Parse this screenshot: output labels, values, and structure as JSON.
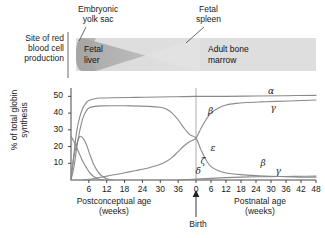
{
  "figure": {
    "callouts": {
      "yolk_sac": "Embryonic\nyolk sac",
      "fetal_spleen": "Fetal\nspleen"
    },
    "site_label": "Site of red\nblood cell\nproduction",
    "bands": [
      {
        "name": "fetal-liver",
        "label": "Fetal\nliver"
      },
      {
        "name": "adult-bone-marrow",
        "label": "Adult bone\nmarrow"
      }
    ],
    "birth_label": "Birth"
  },
  "chart_data": {
    "type": "line",
    "title": "",
    "ylabel": "% of total globin\nsynthesis",
    "ylim": [
      0,
      55
    ],
    "yticks": [
      10,
      20,
      30,
      40,
      50
    ],
    "ytick_labels": [
      "10",
      "20",
      "30",
      "40",
      "50"
    ],
    "grid": false,
    "xlabel_left": "Postconceptual age\n(weeks)",
    "xlabel_right": "Postnatal age\n(weeks)",
    "xticks_left": [
      6,
      12,
      18,
      24,
      30,
      36
    ],
    "xtick_labels_left": [
      "6",
      "12",
      "18",
      "24",
      "30",
      "36"
    ],
    "xticks_right": [
      0,
      6,
      12,
      18,
      24,
      30,
      36,
      42,
      48
    ],
    "xtick_labels_right": [
      "0",
      "6",
      "12",
      "18",
      "24",
      "30",
      "36",
      "42",
      "48"
    ],
    "birth_x": 0,
    "annotations": [
      {
        "text": "α",
        "name": "alpha",
        "x": 30,
        "y": 52
      },
      {
        "text": "γ",
        "name": "gamma-prenatal",
        "x": 31,
        "y": 42
      },
      {
        "text": "β",
        "name": "beta-postnatal",
        "x": 6,
        "y": 40
      },
      {
        "text": "ε",
        "name": "epsilon",
        "x": 7,
        "y": 18
      },
      {
        "text": "ζ",
        "name": "zeta",
        "x": 3,
        "y": 10
      },
      {
        "text": "β",
        "name": "beta-prenatal",
        "x": 27,
        "y": 9
      },
      {
        "text": "δ",
        "name": "delta",
        "x": 1,
        "y": 4
      },
      {
        "text": "γ",
        "name": "gamma-postnatal",
        "x": 33,
        "y": 4
      }
    ],
    "series": [
      {
        "name": "alpha",
        "label": "α",
        "color": "#8a8a8a",
        "points": [
          [
            -42,
            0
          ],
          [
            -41,
            16
          ],
          [
            -40,
            30
          ],
          [
            -39,
            38
          ],
          [
            -38,
            43
          ],
          [
            -37,
            46
          ],
          [
            -36,
            47.5
          ],
          [
            -34,
            48.6
          ],
          [
            -32,
            49
          ],
          [
            -28,
            49.2
          ],
          [
            -20,
            49.4
          ],
          [
            -12,
            49.6
          ],
          [
            -6,
            49.8
          ],
          [
            0,
            50
          ],
          [
            6,
            50
          ],
          [
            12,
            50
          ],
          [
            24,
            50.2
          ],
          [
            36,
            50.4
          ],
          [
            48,
            50.6
          ]
        ]
      },
      {
        "name": "gamma",
        "label": "γ",
        "color": "#8a8a8a",
        "points": [
          [
            -42,
            0
          ],
          [
            -41,
            8
          ],
          [
            -40,
            20
          ],
          [
            -39,
            30
          ],
          [
            -38,
            37
          ],
          [
            -37,
            41
          ],
          [
            -36,
            43
          ],
          [
            -34,
            44
          ],
          [
            -32,
            44.3
          ],
          [
            -28,
            44.4
          ],
          [
            -22,
            44.3
          ],
          [
            -16,
            44
          ],
          [
            -12,
            43.5
          ],
          [
            -10,
            42.5
          ],
          [
            -8,
            40
          ],
          [
            -6,
            36
          ],
          [
            -4,
            31
          ],
          [
            -2,
            27
          ],
          [
            0,
            25
          ],
          [
            2,
            18
          ],
          [
            4,
            12
          ],
          [
            6,
            8
          ],
          [
            9,
            5.5
          ],
          [
            12,
            4.2
          ],
          [
            18,
            3.2
          ],
          [
            24,
            2.6
          ],
          [
            30,
            2.2
          ],
          [
            36,
            1.9
          ],
          [
            42,
            1.7
          ],
          [
            48,
            1.6
          ]
        ]
      },
      {
        "name": "epsilon",
        "label": "ε",
        "color": "#8a8a8a",
        "points": [
          [
            -42,
            2
          ],
          [
            -41,
            14
          ],
          [
            -40,
            22
          ],
          [
            -39,
            26
          ],
          [
            -38,
            25
          ],
          [
            -37,
            22
          ],
          [
            -36,
            17
          ],
          [
            -35,
            12
          ],
          [
            -34,
            8
          ],
          [
            -33,
            5
          ],
          [
            -32,
            3
          ],
          [
            -31,
            1.6
          ],
          [
            -30,
            0.8
          ],
          [
            -29,
            0.3
          ],
          [
            -28,
            0
          ]
        ]
      },
      {
        "name": "zeta",
        "label": "ζ",
        "color": "#8a8a8a",
        "points": [
          [
            -42,
            26
          ],
          [
            -41,
            23
          ],
          [
            -40,
            19
          ],
          [
            -39,
            15
          ],
          [
            -38,
            11
          ],
          [
            -37,
            8
          ],
          [
            -36,
            5
          ],
          [
            -35,
            3
          ],
          [
            -34,
            1.6
          ],
          [
            -33,
            0.8
          ],
          [
            -32,
            0.3
          ],
          [
            -31,
            0
          ]
        ]
      },
      {
        "name": "beta",
        "label": "β",
        "color": "#8a8a8a",
        "points": [
          [
            -38,
            0
          ],
          [
            -36,
            0.4
          ],
          [
            -34,
            1
          ],
          [
            -32,
            1.6
          ],
          [
            -30,
            2.3
          ],
          [
            -28,
            3
          ],
          [
            -26,
            3.6
          ],
          [
            -24,
            4.3
          ],
          [
            -22,
            5
          ],
          [
            -20,
            5.7
          ],
          [
            -18,
            6.4
          ],
          [
            -16,
            7.2
          ],
          [
            -14,
            8.2
          ],
          [
            -12,
            9.4
          ],
          [
            -10,
            11
          ],
          [
            -8,
            13.5
          ],
          [
            -6,
            17
          ],
          [
            -4,
            20.5
          ],
          [
            -2,
            23
          ],
          [
            0,
            25
          ],
          [
            2,
            31
          ],
          [
            4,
            36
          ],
          [
            6,
            40
          ],
          [
            9,
            43
          ],
          [
            12,
            44.8
          ],
          [
            16,
            45.8
          ],
          [
            20,
            46.3
          ],
          [
            26,
            46.7
          ],
          [
            32,
            47
          ],
          [
            40,
            47.4
          ],
          [
            48,
            47.8
          ]
        ]
      },
      {
        "name": "delta",
        "label": "δ",
        "color": "#8a8a8a",
        "points": [
          [
            -6,
            0
          ],
          [
            0,
            0.5
          ],
          [
            6,
            1
          ],
          [
            12,
            1.4
          ],
          [
            18,
            1.7
          ],
          [
            24,
            1.9
          ],
          [
            30,
            2.0
          ],
          [
            36,
            2.1
          ],
          [
            42,
            2.2
          ],
          [
            48,
            2.3
          ]
        ]
      }
    ]
  },
  "colors": {
    "curve": "#8a8a8a",
    "axis": "#333333",
    "band_light": "#dedede",
    "band_mid": "#c9c9c9",
    "band_dark": "#9e9e9e"
  }
}
